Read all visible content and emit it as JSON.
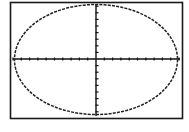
{
  "calculator_screen": {
    "type": "graph",
    "background": "#ffffff",
    "frame_color": "#1a1a1a",
    "curve_color": "#222222",
    "axis_color": "#111111"
  },
  "graph": {
    "curve": "ellipse",
    "window": {
      "x_ticks_each_side": 10,
      "y_ticks_each_side": 8
    }
  }
}
